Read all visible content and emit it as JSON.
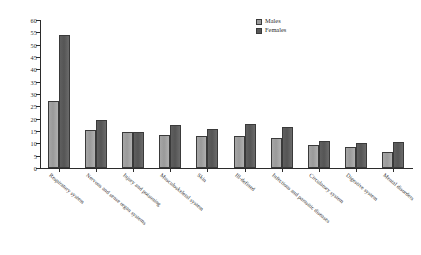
{
  "chart_data": {
    "type": "bar",
    "title": "",
    "xlabel": "",
    "ylabel": "",
    "ylim": [
      0,
      60
    ],
    "yticks": [
      0,
      5,
      10,
      15,
      20,
      25,
      30,
      35,
      40,
      45,
      50,
      55,
      60
    ],
    "grid": false,
    "legend_position": "top-right",
    "categories": [
      "Respiratory system",
      "Nervous and sense organ systems",
      "Injury and poisoning",
      "Musculoskeletal system",
      "Skin",
      "Ill-defined",
      "Infectious and parasitic diseases",
      "Circulatory system",
      "Digestive system",
      "Mental disorders"
    ],
    "series": [
      {
        "name": "Males",
        "color": "#9a9a9a",
        "values": [
          27,
          15.5,
          14.5,
          13.5,
          13,
          13,
          12,
          9.5,
          8.5,
          6.5
        ]
      },
      {
        "name": "Females",
        "color": "#585858",
        "values": [
          54,
          19.5,
          14.5,
          17.5,
          16,
          18,
          16.5,
          11,
          10,
          10.5
        ]
      }
    ]
  },
  "legend": {
    "items": [
      {
        "label": "Males",
        "swatch": "males-swatch"
      },
      {
        "label": "Females",
        "swatch": "females-swatch"
      }
    ]
  }
}
